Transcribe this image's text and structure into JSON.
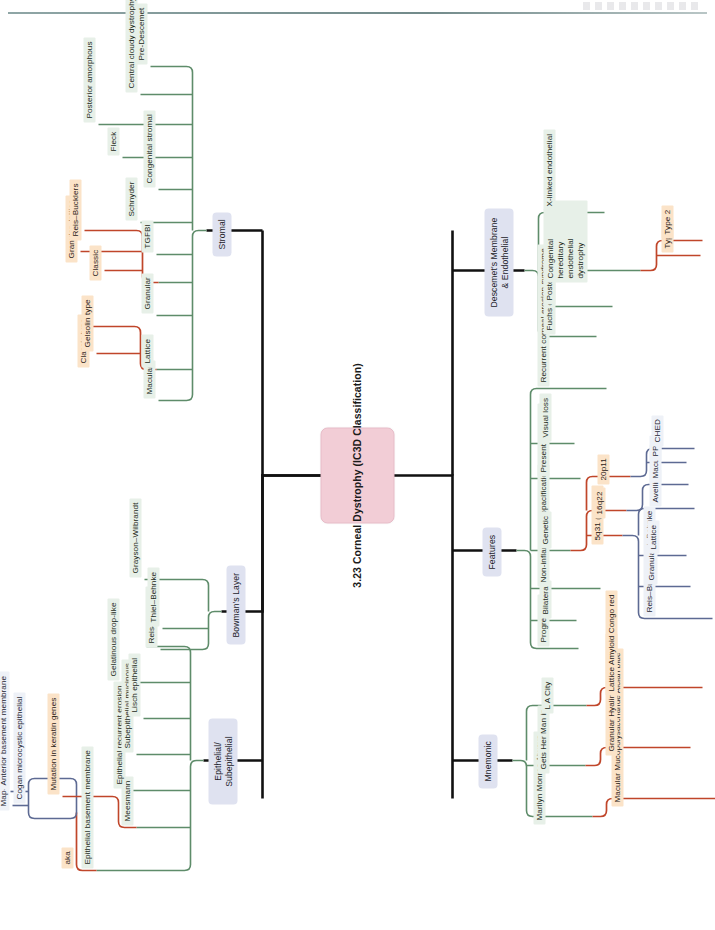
{
  "page": {
    "header_rule": true,
    "background": "#ffffff"
  },
  "colors": {
    "root_fill": "#f2cdd6",
    "category_fill": "#dfe2f0",
    "green_fill": "#e7f0e8",
    "green_line": "#5e8c6a",
    "orange_fill": "#fbe3c8",
    "orange_line": "#c0462a",
    "blue_fill": "#eef1f7",
    "blue_line": "#5d6a93",
    "trunk_line": "#111111"
  },
  "root": {
    "label": "3.23 Corneal Dystrophy (IC3D Classification)"
  },
  "branches": [
    {
      "id": "epithelial",
      "label": "Epithelial/ Subepithelial",
      "children": [
        {
          "label": "Epithelial basement membrane",
          "link_label": "aka",
          "children": [
            {
              "label": "Map-dot-fingerprint"
            },
            {
              "label": "Cogan microcystic epithelial"
            },
            {
              "label": "Anterior basement membrane"
            }
          ]
        },
        {
          "label": "Meesmann",
          "children": [
            {
              "label": "Mutation in keratin genes"
            }
          ]
        },
        {
          "label": "Epithelial recurrent erosion"
        },
        {
          "label": "Subepithelial mucinous"
        },
        {
          "label": "Lisch epithelial"
        },
        {
          "label": "Gelatinous drop-like"
        }
      ]
    },
    {
      "id": "bowman",
      "label": "Bowman's Layer",
      "children": [
        {
          "label": "Reis–Bucklers"
        },
        {
          "label": "Thiel–Behnke"
        },
        {
          "label": "Grayson–Wilbrandt"
        }
      ]
    },
    {
      "id": "stromal",
      "label": "Stromal",
      "children": [
        {
          "label": "Macular"
        },
        {
          "label": "Lattice",
          "children": [
            {
              "label": "Classic type"
            },
            {
              "label": "Gelsolin type"
            }
          ]
        },
        {
          "label": "Granular",
          "children": [
            {
              "label": "Classic"
            },
            {
              "label": "Granular–lattice"
            },
            {
              "label": "Reis–Bucklers"
            }
          ]
        },
        {
          "label": "TGFBI"
        },
        {
          "label": "Schnyder"
        },
        {
          "label": "Congenital stromal"
        },
        {
          "label": "Fleck"
        },
        {
          "label": "Posterior amorphous"
        },
        {
          "label": "Central cloudy dystrophy of Francois"
        },
        {
          "label": "Pre-Descemet"
        }
      ]
    },
    {
      "id": "mnemonic",
      "label": "Mnemonic",
      "children": [
        {
          "label": "Marilyn Monroe Always",
          "children": [
            {
              "label": "Macular Mucopolysaccharide Alcian blue"
            }
          ]
        },
        {
          "label": "Gets Her Man in",
          "children": [
            {
              "label": "Granular Hyaline Masson stain"
            }
          ]
        },
        {
          "label": "L A City",
          "children": [
            {
              "label": "Lattice Amyloid Congo red"
            }
          ]
        }
      ]
    },
    {
      "id": "features",
      "label": "Features",
      "children": [
        {
          "label": "Progressive"
        },
        {
          "label": "Bilateral"
        },
        {
          "label": "Non-inflammatory opacification"
        },
        {
          "label": "Genetic",
          "children": [
            {
              "label": "5q31 (TGFBI)",
              "children": [
                {
                  "label": "Reis–Buckler/Thiel–Behnke"
                },
                {
                  "label": "Granular"
                },
                {
                  "label": "Lattice"
                },
                {
                  "label": "Avellino"
                }
              ]
            },
            {
              "label": "16q22",
              "children": [
                {
                  "label": "Macular"
                }
              ]
            },
            {
              "label": "20p11",
              "children": [
                {
                  "label": "PPD"
                },
                {
                  "label": "CHED"
                }
              ]
            }
          ]
        },
        {
          "label": "Present 10–40 yo"
        },
        {
          "label": "Visual loss"
        },
        {
          "label": "Recurrent corneal erosion syndrome"
        }
      ]
    },
    {
      "id": "descemet",
      "label": "Descemet's Membrane & Endothelial",
      "children": [
        {
          "label": "Fuchs endothelial"
        },
        {
          "label": "Posterior polymorphous"
        },
        {
          "label": "Congenital hereditary endothelial dystrophy",
          "children": [
            {
              "label": "Type 1"
            },
            {
              "label": "Type 2"
            }
          ]
        },
        {
          "label": "X-linked endothelial"
        }
      ]
    }
  ]
}
